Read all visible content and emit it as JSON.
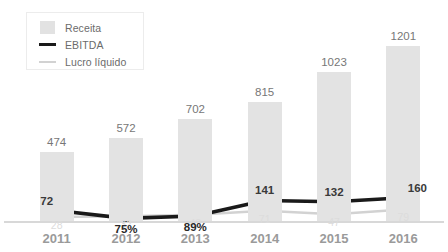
{
  "legend": {
    "items": [
      {
        "label": "Receita",
        "mark": "bar-swatch-icon",
        "color": "#e3e3e3"
      },
      {
        "label": "EBITDA",
        "mark": "thick-line-icon",
        "color": "#1a1a1a"
      },
      {
        "label": "Lucro líquido",
        "mark": "thin-line-icon",
        "color": "#d2d2d2"
      }
    ]
  },
  "chart_data": {
    "type": "bar",
    "title": "",
    "subtitle": "",
    "xlabel": "",
    "ylabel": "",
    "grid": false,
    "legend_position": "top-left",
    "ylim": [
      0,
      1280
    ],
    "categories": [
      "2011",
      "2012",
      "2013",
      "2014",
      "2015",
      "2016"
    ],
    "series": [
      {
        "name": "Receita",
        "type": "bar",
        "color": "#e3e3e3",
        "values": [
          474,
          572,
          702,
          815,
          1023,
          1201
        ],
        "labels": [
          "474",
          "572",
          "702",
          "815",
          "1023",
          "1201"
        ]
      },
      {
        "name": "EBITDA",
        "type": "line",
        "color": "#1a1a1a",
        "values": [
          72,
          18,
          34,
          141,
          132,
          160
        ],
        "labels": [
          "72",
          "75%",
          "89%",
          "141",
          "132",
          "160"
        ]
      },
      {
        "name": "Lucro líquido",
        "type": "line",
        "color": "#d2d2d2",
        "values": [
          28,
          32,
          43,
          71,
          47,
          79
        ],
        "labels": [
          "28",
          "32",
          "43",
          "71",
          "47",
          "79"
        ]
      }
    ]
  }
}
